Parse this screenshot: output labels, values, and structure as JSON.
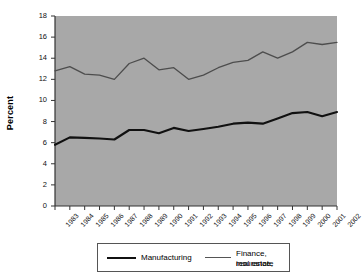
{
  "chart_data": {
    "type": "line",
    "title": "",
    "subtitle": "",
    "xlabel": "",
    "ylabel": "Percent",
    "ylim": [
      0,
      18
    ],
    "ytick_step": 2,
    "yticks": [
      "0",
      "2",
      "4",
      "6",
      "8",
      "10",
      "12",
      "14",
      "16",
      "18"
    ],
    "grid": false,
    "legend_position": "bottom",
    "x": [
      "1983",
      "1984",
      "1985",
      "1986",
      "1987",
      "1988",
      "1989",
      "1990",
      "1991",
      "1992",
      "1993",
      "1994",
      "1995",
      "1996",
      "1997",
      "1998",
      "1999",
      "2000",
      "2001",
      "2002"
    ],
    "categories": [
      "1983",
      "1984",
      "1985",
      "1986",
      "1987",
      "1988",
      "1989",
      "1990",
      "1991",
      "1992",
      "1993",
      "1994",
      "1995",
      "1996",
      "1997",
      "1998",
      "1999",
      "2000",
      "2001",
      "2002"
    ],
    "series": [
      {
        "name": "Manufacturing",
        "color": "#111111",
        "width": 2.1,
        "values": [
          5.8,
          6.5,
          6.45,
          6.4,
          6.3,
          7.2,
          7.2,
          6.9,
          7.4,
          7.1,
          7.3,
          7.5,
          7.8,
          7.9,
          7.8,
          8.3,
          8.8,
          8.9,
          8.5,
          8.9
        ]
      },
      {
        "name": "Finance, insurance, real estate",
        "color": "#4d4d4d",
        "width": 1.3,
        "values": [
          12.8,
          13.2,
          12.5,
          12.4,
          12.0,
          13.5,
          14.0,
          12.9,
          13.1,
          12.0,
          12.4,
          13.1,
          13.6,
          13.8,
          14.6,
          14.0,
          14.6,
          15.5,
          15.3,
          15.5
        ]
      }
    ],
    "plot_background": "#a8a8a8",
    "figure_background": "#ffffff",
    "axis_color": "#333333"
  },
  "legend": {
    "entries": [
      {
        "label_line1": "Manufacturing",
        "label_line2": "",
        "style": "thick"
      },
      {
        "label_line1": "Finance, insurance,",
        "label_line2": "real estate",
        "style": "thin"
      }
    ]
  }
}
